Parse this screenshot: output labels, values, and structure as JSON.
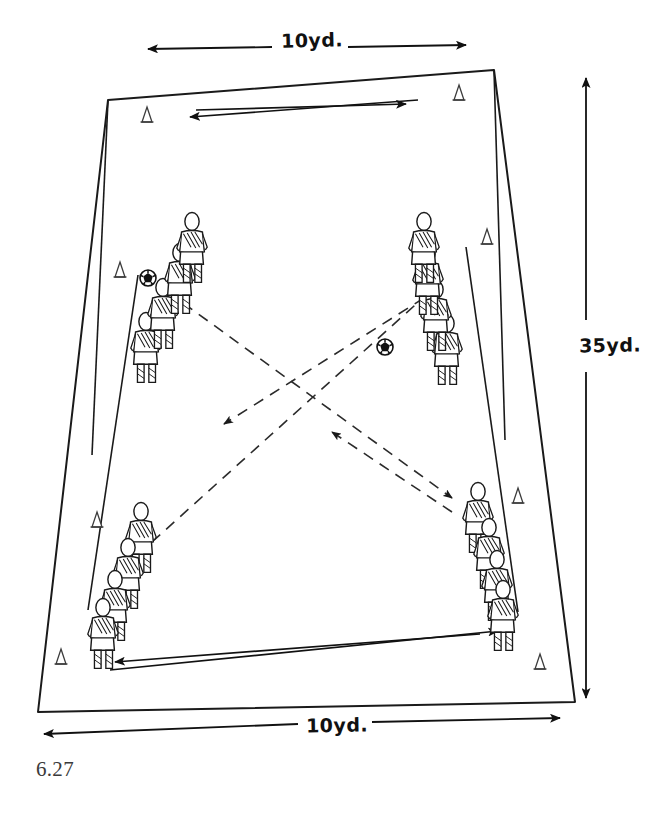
{
  "figure": {
    "caption": "6.27",
    "type": "soccer-drill-diagram"
  },
  "dimensions": {
    "top": {
      "label": "10yd.",
      "arrow": "double"
    },
    "right": {
      "label": "35yd.",
      "arrow": "double"
    },
    "bottom": {
      "label": "10yd.",
      "arrow": "double"
    }
  },
  "field": {
    "shape": "trapezoid",
    "corners": [
      {
        "name": "top-left",
        "x": 108,
        "y": 100
      },
      {
        "name": "top-right",
        "x": 494,
        "y": 70
      },
      {
        "name": "bottom-right",
        "x": 575,
        "y": 702
      },
      {
        "name": "bottom-left",
        "x": 38,
        "y": 712
      }
    ],
    "stroke": "#1a1a1a"
  },
  "player_groups": [
    {
      "name": "top-left-group",
      "count": 4,
      "x": 160,
      "y": 180
    },
    {
      "name": "top-right-group",
      "count": 4,
      "x": 437,
      "y": 170
    },
    {
      "name": "bottom-left-group",
      "count": 4,
      "x": 120,
      "y": 540
    },
    {
      "name": "bottom-right-group",
      "count": 4,
      "x": 482,
      "y": 535
    }
  ],
  "balls": [
    {
      "name": "ball-top-left",
      "x": 148,
      "y": 278
    },
    {
      "name": "ball-center",
      "x": 385,
      "y": 347
    }
  ],
  "cones": [
    {
      "name": "cone-top-left",
      "x": 147,
      "y": 116
    },
    {
      "name": "cone-top-right",
      "x": 459,
      "y": 94
    },
    {
      "name": "cone-left-upper",
      "x": 120,
      "y": 271
    },
    {
      "name": "cone-right-upper",
      "x": 487,
      "y": 238
    },
    {
      "name": "cone-left-lower",
      "x": 97,
      "y": 521
    },
    {
      "name": "cone-right-lower",
      "x": 518,
      "y": 497
    },
    {
      "name": "cone-bottom-left",
      "x": 61,
      "y": 658
    },
    {
      "name": "cone-bottom-right",
      "x": 540,
      "y": 663
    }
  ],
  "movement": {
    "solid_arrows": [
      {
        "name": "top-run-left",
        "from": [
          415,
          100
        ],
        "to": [
          188,
          116
        ],
        "head": "end"
      },
      {
        "name": "top-run-right",
        "from": [
          196,
          110
        ],
        "to": [
          409,
          103
        ],
        "head": "end"
      },
      {
        "name": "bottom-run-left",
        "from": [
          478,
          633
        ],
        "to": [
          113,
          662
        ],
        "head": "end"
      },
      {
        "name": "bottom-run-right",
        "from": [
          108,
          668
        ],
        "to": [
          500,
          630
        ],
        "head": "end"
      }
    ],
    "dashed_arrows": [
      {
        "name": "pass-bottom-left-to-top-right",
        "from": [
          152,
          540
        ],
        "to": [
          438,
          284
        ],
        "head": "end"
      },
      {
        "name": "pass-top-left-to-bottom-right",
        "from": [
          165,
          290
        ],
        "to": [
          455,
          500
        ],
        "head": "end"
      },
      {
        "name": "pass-top-right-to-bottom-left",
        "from": [
          420,
          300
        ],
        "to": [
          222,
          425
        ],
        "head": "end"
      },
      {
        "name": "pass-bottom-right-to-top-left",
        "from": [
          450,
          512
        ],
        "to": [
          330,
          432
        ],
        "head": "end"
      }
    ]
  },
  "colors": {
    "ink": "#1a1a1a",
    "paper": "#ffffff",
    "dashed": "#555555",
    "caption": "#3a3a3a"
  }
}
